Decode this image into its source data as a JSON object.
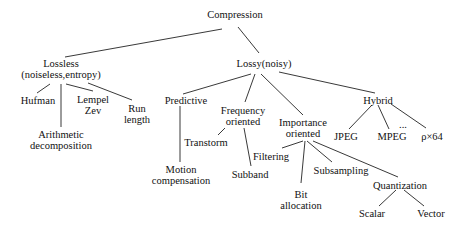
{
  "diagram": {
    "title": "Compression",
    "nodes": {
      "root": {
        "label": "Compression",
        "x": 235,
        "y": 14
      },
      "lossless": {
        "label": "Lossless",
        "label2": "(noiseless,entropy)",
        "x": 61,
        "y": 58
      },
      "lossy": {
        "label": "Lossy(noisy)",
        "x": 264,
        "y": 58
      },
      "hufman": {
        "label": "Hufman",
        "x": 38,
        "y": 98
      },
      "arith": {
        "label": "Arithmetic",
        "label2": "decomposition",
        "x": 61,
        "y": 133
      },
      "lempel": {
        "label": "Lempel",
        "label2": "Zev",
        "x": 93,
        "y": 96
      },
      "run": {
        "label": "Run",
        "label2": "length",
        "x": 136,
        "y": 104
      },
      "predictive": {
        "label": "Predictive",
        "x": 186,
        "y": 98
      },
      "motion": {
        "label": "Motion",
        "label2": "compensation",
        "x": 181,
        "y": 167
      },
      "frequency": {
        "label": "Frequency",
        "label2": "oriented",
        "x": 243,
        "y": 107
      },
      "transform": {
        "label": "Transtorm",
        "x": 207,
        "y": 140
      },
      "subband": {
        "label": "Subband",
        "x": 250,
        "y": 172
      },
      "importance": {
        "label": "Importance",
        "label2": "oriented",
        "x": 301,
        "y": 119
      },
      "filtering": {
        "label": "Filtering",
        "x": 272,
        "y": 153
      },
      "bitalloc": {
        "label": "Bit",
        "label2": "allocation",
        "x": 302,
        "y": 190
      },
      "subsampling": {
        "label": "Subsampling",
        "x": 340,
        "y": 168
      },
      "quantization": {
        "label": "Quantization",
        "x": 400,
        "y": 183
      },
      "scalar": {
        "label": "Scalar",
        "x": 373,
        "y": 212
      },
      "vector": {
        "label": "Vector",
        "x": 431,
        "y": 212
      },
      "hybrid": {
        "label": "Hybrid",
        "x": 376,
        "y": 98
      },
      "jpeg": {
        "label": "JPEG",
        "x": 345,
        "y": 134
      },
      "mpeg": {
        "label": "MPEG",
        "x": 391,
        "y": 134
      },
      "ellipsis": {
        "label": "...",
        "x": 402,
        "y": 122
      },
      "px64": {
        "label": "ρ×64",
        "x": 431,
        "y": 134
      }
    },
    "edges": [
      [
        "root",
        "lossless"
      ],
      [
        "root",
        "lossy"
      ],
      [
        "lossless",
        "hufman"
      ],
      [
        "lossless",
        "arith"
      ],
      [
        "lossless",
        "lempel"
      ],
      [
        "lossless",
        "run"
      ],
      [
        "lossy",
        "predictive"
      ],
      [
        "lossy",
        "frequency"
      ],
      [
        "lossy",
        "importance"
      ],
      [
        "lossy",
        "hybrid"
      ],
      [
        "predictive",
        "motion"
      ],
      [
        "frequency",
        "transform"
      ],
      [
        "frequency",
        "subband"
      ],
      [
        "importance",
        "filtering"
      ],
      [
        "importance",
        "bitalloc"
      ],
      [
        "importance",
        "subsampling"
      ],
      [
        "importance",
        "quantization"
      ],
      [
        "quantization",
        "scalar"
      ],
      [
        "quantization",
        "vector"
      ],
      [
        "hybrid",
        "jpeg"
      ],
      [
        "hybrid",
        "mpeg"
      ],
      [
        "hybrid",
        "px64"
      ]
    ]
  }
}
